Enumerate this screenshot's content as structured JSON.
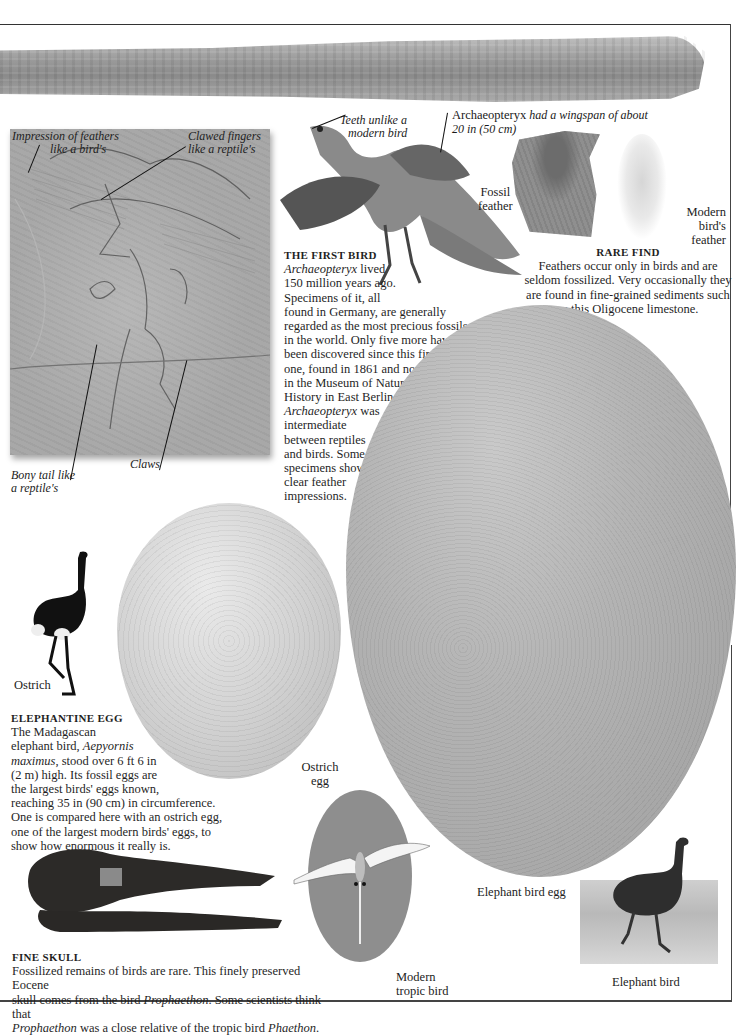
{
  "page": {
    "background": "#ffffff",
    "frame_color": "#333333"
  },
  "specimens": {
    "bone": {
      "name": "fossil bone",
      "color": "#9a9a9a"
    },
    "archaeopteryx_slab": {
      "callouts": {
        "feathers": {
          "line1": "Impression of feathers",
          "line2": "like a bird's"
        },
        "fingers": {
          "line1": "Clawed fingers",
          "line2": "like a reptile's"
        },
        "tail": {
          "line1": "Bony tail like",
          "line2": "a reptile's"
        },
        "claws": "Claws"
      }
    },
    "archaeopteryx_model": {
      "teeth_callout": {
        "line1": "Teeth unlike a",
        "line2": "modern bird"
      },
      "wingspan_callout": {
        "name": "Archaeopteryx",
        "rest1": " had a wingspan of about",
        "line2": "20 in (50 cm)"
      }
    },
    "feathers": {
      "fossil_label": {
        "line1": "Fossil",
        "line2": "feather"
      },
      "modern_label": {
        "line1": "Modern",
        "line2": "bird's",
        "line3": "feather"
      }
    },
    "eggs": {
      "ostrich_label": {
        "line1": "Ostrich",
        "line2": "egg"
      },
      "elephant_label": "Elephant bird egg",
      "ostrich_color": "#d2d2d2",
      "elephant_color": "#b0b0b0"
    },
    "ostrich_label": "Ostrich",
    "tropic_label": {
      "line1": "Modern",
      "line2": "tropic bird"
    },
    "elephant_bird_label": "Elephant bird"
  },
  "sections": {
    "first_bird": {
      "heading": "THE FIRST BIRD",
      "lines": [
        {
          "italic": "Archaeopteryx",
          "text": " lived"
        },
        {
          "text": "150 million years ago."
        },
        {
          "text": "Specimens of it, all"
        },
        {
          "text": "found in Germany, are generally"
        },
        {
          "text": "regarded as the most precious fossils"
        },
        {
          "text": "in the world. Only five more have"
        },
        {
          "text": "been discovered since this first"
        },
        {
          "text": "one, found in 1861 and now"
        },
        {
          "text": "in the Museum of Natural"
        },
        {
          "text": "History in East Berlin."
        },
        {
          "italic": "Archaeopteryx",
          "text": " was"
        },
        {
          "text": "intermediate"
        },
        {
          "text": "between reptiles"
        },
        {
          "text": "and birds. Some"
        },
        {
          "text": "specimens show"
        },
        {
          "text": "clear feather"
        },
        {
          "text": "impressions."
        }
      ]
    },
    "rare_find": {
      "heading": "RARE FIND",
      "lines": [
        "Feathers occur only in birds and are",
        "seldom fossilized. Very occasionally they",
        "are found in fine-grained sediments such",
        "as this Oligocene limestone."
      ]
    },
    "elephantine_egg": {
      "heading": "ELEPHANTINE EGG",
      "lines": [
        {
          "text": "The Madagascan"
        },
        {
          "text": "elephant bird, ",
          "italic": "Aepyornis"
        },
        {
          "italic": "maximus",
          "text": ", stood over 6 ft 6 in"
        },
        {
          "text": "(2 m) high. Its fossil eggs are"
        },
        {
          "text": "the largest birds' eggs known,"
        },
        {
          "text": "reaching 35 in (90 cm) in circumference."
        },
        {
          "text": "One is compared here with an ostrich egg,"
        },
        {
          "text": "one of the largest modern birds' eggs, to"
        },
        {
          "text": "show how enormous it really is."
        }
      ]
    },
    "fine_skull": {
      "heading": "FINE SKULL",
      "line1": "Fossilized remains of birds are rare. This finely preserved Eocene",
      "line2_a": "skull comes from the bird ",
      "line2_i": "Prophaethon",
      "line2_b": ". Some scientists think that",
      "line3_i1": "Prophaethon",
      "line3_a": " was a close relative of the tropic bird ",
      "line3_i2": "Phaethon",
      "line3_b": "."
    }
  }
}
